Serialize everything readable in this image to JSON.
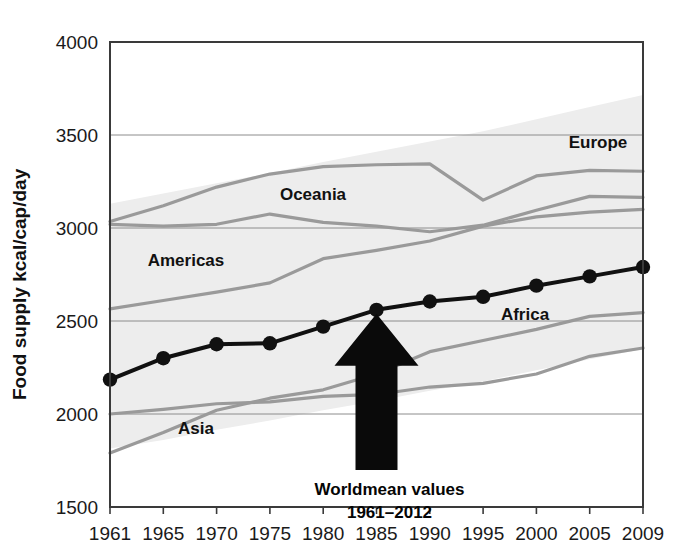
{
  "chart_data": {
    "type": "line",
    "title": "",
    "xlabel": "",
    "ylabel": "Food supply kcal/cap/day",
    "x": [
      1961,
      1965,
      1970,
      1975,
      1980,
      1985,
      1990,
      1995,
      2000,
      2005,
      2009
    ],
    "xtick_labels": [
      "1961",
      "1965",
      "1970",
      "1975",
      "1980",
      "1985",
      "1990",
      "1995",
      "2000",
      "2005",
      "2009"
    ],
    "ytick_labels": [
      "1500",
      "2000",
      "2500",
      "3000",
      "3500",
      "4000"
    ],
    "yticks": [
      1500,
      2000,
      2500,
      3000,
      3500,
      4000
    ],
    "ylim": [
      1500,
      4000
    ],
    "xlim": [
      1961,
      2009
    ],
    "grid": true,
    "legend_position": "inline-labels",
    "series": [
      {
        "name": "Worldmean",
        "label": "Worldmean values",
        "style": "black-thick-markers",
        "color": "#111111",
        "values": [
          2185,
          2300,
          2375,
          2380,
          2470,
          2560,
          2605,
          2630,
          2690,
          2740,
          2790
        ]
      },
      {
        "name": "Europe",
        "label": "Europe",
        "style": "gray",
        "color": "#9a9a9a",
        "values": [
          3035,
          3120,
          3220,
          3290,
          3330,
          3340,
          3345,
          3150,
          3280,
          3310,
          3305
        ]
      },
      {
        "name": "Oceania",
        "label": "Oceania",
        "style": "gray",
        "color": "#9a9a9a",
        "values": [
          3020,
          3010,
          3020,
          3075,
          3030,
          3010,
          2980,
          3015,
          3095,
          3170,
          3165
        ]
      },
      {
        "name": "Americas",
        "label": "Americas",
        "style": "gray",
        "color": "#9a9a9a",
        "values": [
          2565,
          2610,
          2655,
          2705,
          2835,
          2880,
          2930,
          3010,
          3060,
          3085,
          3100
        ]
      },
      {
        "name": "Asia",
        "label": "Asia",
        "style": "gray",
        "color": "#9a9a9a",
        "values": [
          1790,
          1900,
          2020,
          2085,
          2130,
          2215,
          2335,
          2395,
          2455,
          2525,
          2545
        ]
      },
      {
        "name": "Africa",
        "label": "Africa",
        "style": "gray",
        "color": "#9a9a9a",
        "values": [
          2000,
          2025,
          2055,
          2065,
          2095,
          2105,
          2145,
          2165,
          2215,
          2310,
          2355
        ]
      }
    ],
    "band": {
      "name": "min-max range",
      "color": "#ededed",
      "upper": [
        3130,
        3185,
        3240,
        3295,
        3355,
        3410,
        3465,
        3520,
        3585,
        3650,
        3715
      ],
      "lower": [
        1815,
        1860,
        1915,
        1965,
        2020,
        2070,
        2125,
        2175,
        2235,
        2295,
        2350
      ]
    },
    "annotations": [
      {
        "name": "worldmean-arrow",
        "type": "arrow-up",
        "at_x": 1985,
        "at_y": 2560,
        "text_line1": "Worldmean values",
        "text_line2": "1961–2012"
      }
    ],
    "series_labels": [
      {
        "name": "Europe",
        "x": 598,
        "y": 148
      },
      {
        "name": "Oceania",
        "x": 313,
        "y": 200
      },
      {
        "name": "Americas",
        "x": 186,
        "y": 266
      },
      {
        "name": "Asia",
        "x": 196,
        "y": 434
      },
      {
        "name": "Africa",
        "x": 525,
        "y": 320
      }
    ]
  },
  "axes": {
    "y_axis_title": "Food supply kcal/cap/day"
  }
}
